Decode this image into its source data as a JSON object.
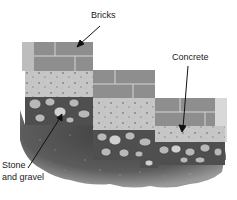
{
  "labels": {
    "bricks": "Bricks",
    "concrete": "Concrete",
    "stone_line1": "Stone",
    "stone_line2": "and gravel"
  },
  "colors": {
    "brick": "#8e8e8e",
    "brick_mortar": "#d4d4d4",
    "concrete": "#c9c9c9",
    "concrete_speck": "#8a8a8a",
    "stone_bed": "#4f4f4f",
    "stone_fill": "#b8b8b8",
    "soil": "#5a5a5a",
    "arrow": "#111111"
  }
}
